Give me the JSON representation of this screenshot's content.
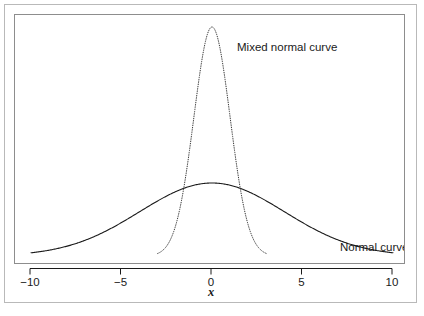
{
  "chart_data": {
    "type": "line",
    "title": "",
    "xlabel": "x",
    "ylabel": "",
    "xlim": [
      -10,
      10
    ],
    "ylim": [
      0,
      0.42
    ],
    "grid": false,
    "legend_position": "inline-annotations",
    "xticks": [
      -10,
      -5,
      0,
      5,
      10
    ],
    "xtick_labels": [
      "−10",
      "−5",
      "0",
      "5",
      "10"
    ],
    "series": [
      {
        "name": "Normal curve",
        "style": "solid",
        "color": "#1a1a1a",
        "description": "Wide normal density, mean 0, standard deviation 4, drawn across full x range from -10 to 10",
        "mean": 0,
        "sd": 4,
        "peak_value": 0.0997,
        "x": [
          -10,
          -9,
          -8,
          -7,
          -6,
          -5,
          -4,
          -3,
          -2,
          -1,
          0,
          1,
          2,
          3,
          4,
          5,
          6,
          7,
          8,
          9,
          10
        ],
        "y": [
          0.0088,
          0.013,
          0.018,
          0.024,
          0.0305,
          0.0372,
          0.044,
          0.0501,
          0.055,
          0.0584,
          0.0997,
          0.0584,
          0.055,
          0.0501,
          0.044,
          0.0372,
          0.0305,
          0.024,
          0.018,
          0.013,
          0.0088
        ]
      },
      {
        "name": "Mixed normal curve",
        "style": "dotted",
        "color": "#3a3a3a",
        "description": "Narrow peaked mixture density, mean 0, drawn only between about x = -3 and x = 3",
        "mean": 0,
        "sd": 1,
        "peak_value": 0.399,
        "x_range_drawn": [
          -3.0,
          3.0
        ],
        "x": [
          -3,
          -2.5,
          -2,
          -1.5,
          -1,
          -0.5,
          0,
          0.5,
          1,
          1.5,
          2,
          2.5,
          3
        ],
        "y": [
          0.0044,
          0.0175,
          0.054,
          0.1295,
          0.242,
          0.3521,
          0.3989,
          0.3521,
          0.242,
          0.1295,
          0.054,
          0.0175,
          0.0044
        ]
      }
    ],
    "annotations": [
      {
        "text": "Mixed normal curve",
        "x": 1.2,
        "y": 0.4
      },
      {
        "text": "Normal curve",
        "x": 6.5,
        "y": 0.055
      }
    ]
  },
  "figure": {
    "axis": {
      "title": "x",
      "tick_labels": [
        "−10",
        "−5",
        "0",
        "5",
        "10"
      ]
    },
    "labels": {
      "mixed_normal": "Mixed normal curve",
      "normal": "Normal curve"
    },
    "colors": {
      "outer_frame": "#b9b9b9",
      "plot_frame": "#8d8d8d",
      "normal_curve": "#1a1a1a",
      "mixed_curve": "#3a3a3a",
      "background": "#ffffff",
      "text": "#1a1a1a"
    }
  }
}
